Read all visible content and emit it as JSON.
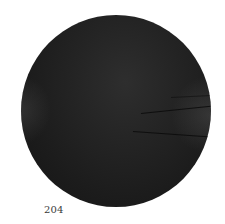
{
  "figure": {
    "disk_color": "#1f1f1f",
    "background_color": "#ffffff"
  },
  "page": {
    "number": "204"
  }
}
